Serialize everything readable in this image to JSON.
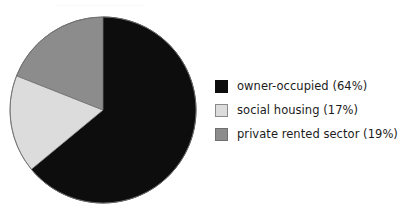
{
  "figure": {
    "background_color": "#ffffff",
    "top_bleed_text": "................................."
  },
  "chart_data": {
    "type": "pie",
    "title": "",
    "subtitle": "",
    "xlabel": "",
    "ylabel": "",
    "grid": false,
    "legend_position": "right",
    "start_angle_deg": 0,
    "direction": "clockwise",
    "categories": [
      "owner-occupied",
      "social housing",
      "private rented sector"
    ],
    "values": [
      64,
      17,
      19
    ],
    "value_unit": "%",
    "colors": [
      "#0d0d0d",
      "#dcdcdc",
      "#8c8c8c"
    ],
    "edge_colors": [
      "#0d0d0d",
      "#8a8a8a",
      "#6f6f6f"
    ],
    "data_labels": [
      "owner-occupied (64%)",
      "social housing (17%)",
      "private rented sector (19%)"
    ],
    "annotations": []
  },
  "pie": {
    "center_x": 95,
    "center_y": 96,
    "radius": 93,
    "outline_color": "#6f6f6f"
  },
  "legend": {
    "items": [
      {
        "label": "owner-occupied (64%)",
        "swatch_fill": "#0d0d0d",
        "swatch_border": "#0d0d0d",
        "swatch_name": "legend-swatch-owner-occupied"
      },
      {
        "label": "social housing (17%)",
        "swatch_fill": "#dcdcdc",
        "swatch_border": "#8a8a8a",
        "swatch_name": "legend-swatch-social-housing"
      },
      {
        "label": "private rented sector (19%)",
        "swatch_fill": "#8c8c8c",
        "swatch_border": "#6f6f6f",
        "swatch_name": "legend-swatch-private-rented-sector"
      }
    ]
  }
}
